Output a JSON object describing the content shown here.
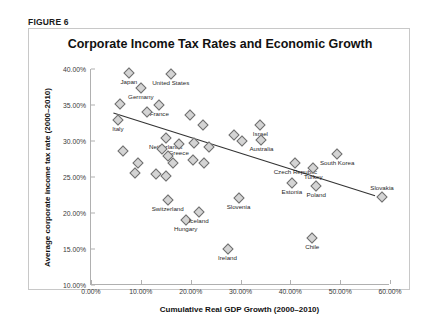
{
  "figure": {
    "tag": "FIGURE 6"
  },
  "chart_data": {
    "type": "scatter",
    "title": "Corporate Income Tax Rates and Economic Growth",
    "xlabel": "Cumulative Real GDP Growth (2000–2010)",
    "ylabel": "Average corporate income tax rate (2000–2010)",
    "xlim": [
      0,
      60
    ],
    "ylim": [
      10,
      40
    ],
    "xticks": [
      "0.00%",
      "10.00%",
      "20.00%",
      "30.00%",
      "40.00%",
      "50.00%",
      "60.00%"
    ],
    "xtick_values": [
      0,
      10,
      20,
      30,
      40,
      50,
      60
    ],
    "yticks": [
      "10.00%",
      "15.00%",
      "20.00%",
      "25.00%",
      "30.00%",
      "35.00%",
      "40.00%"
    ],
    "ytick_values": [
      10,
      15,
      20,
      25,
      30,
      35,
      40
    ],
    "grid": false,
    "legend": null,
    "marker": {
      "shape": "diamond",
      "fill": "#d4d4d4",
      "edge": "#6e6e6e"
    },
    "trendline": {
      "type": "linear",
      "color": "#333333",
      "x_start": 4.5,
      "y_start": 33.9,
      "x_end": 57.0,
      "y_end": 22.4
    },
    "points": [
      {
        "label": "Japan",
        "x": 7.6,
        "y": 39.5,
        "label_pos": "below"
      },
      {
        "label": "United States",
        "x": 16.0,
        "y": 39.3,
        "label_pos": "below"
      },
      {
        "label": "Germany",
        "x": 10.0,
        "y": 37.4,
        "label_pos": "below"
      },
      {
        "label": "France",
        "x": 13.7,
        "y": 35.0,
        "label_pos": "below"
      },
      {
        "label": "Italy",
        "x": 5.4,
        "y": 32.9,
        "label_pos": "below"
      },
      {
        "label": "Netherlands",
        "x": 15.0,
        "y": 30.4,
        "label_pos": "below"
      },
      {
        "label": "Greece",
        "x": 17.6,
        "y": 29.6,
        "label_pos": "below"
      },
      {
        "label": "Israel",
        "x": 34.0,
        "y": 32.2,
        "label_pos": "below"
      },
      {
        "label": "Australia",
        "x": 34.2,
        "y": 30.2,
        "label_pos": "below"
      },
      {
        "label": "Czech Republic",
        "x": 41.0,
        "y": 27.0,
        "label_pos": "below"
      },
      {
        "label": "South Korea",
        "x": 49.4,
        "y": 28.2,
        "label_pos": "below"
      },
      {
        "label": "Turkey",
        "x": 44.6,
        "y": 26.3,
        "label_pos": "below"
      },
      {
        "label": "Poland",
        "x": 45.2,
        "y": 23.8,
        "label_pos": "below"
      },
      {
        "label": "Estonia",
        "x": 40.3,
        "y": 24.1,
        "label_pos": "below"
      },
      {
        "label": "Slovakia",
        "x": 58.4,
        "y": 22.2,
        "label_pos": "above"
      },
      {
        "label": "Switzerland",
        "x": 15.4,
        "y": 21.8,
        "label_pos": "below"
      },
      {
        "label": "Hungary",
        "x": 19.0,
        "y": 19.0,
        "label_pos": "below"
      },
      {
        "label": "Iceland",
        "x": 21.6,
        "y": 20.1,
        "label_pos": "below"
      },
      {
        "label": "Ireland",
        "x": 27.4,
        "y": 15.0,
        "label_pos": "below"
      },
      {
        "label": "Chile",
        "x": 44.4,
        "y": 16.5,
        "label_pos": "below"
      },
      {
        "label": "Slovenia",
        "x": 29.6,
        "y": 22.1,
        "label_pos": "below"
      },
      {
        "label": "",
        "x": 5.8,
        "y": 35.2,
        "label_pos": "none"
      },
      {
        "label": "",
        "x": 11.3,
        "y": 34.0,
        "label_pos": "none"
      },
      {
        "label": "",
        "x": 6.4,
        "y": 28.6,
        "label_pos": "none"
      },
      {
        "label": "",
        "x": 9.5,
        "y": 27.0,
        "label_pos": "none"
      },
      {
        "label": "",
        "x": 8.9,
        "y": 25.6,
        "label_pos": "none"
      },
      {
        "label": "",
        "x": 14.3,
        "y": 28.9,
        "label_pos": "none"
      },
      {
        "label": "",
        "x": 15.4,
        "y": 27.9,
        "label_pos": "none"
      },
      {
        "label": "",
        "x": 16.5,
        "y": 26.9,
        "label_pos": "none"
      },
      {
        "label": "",
        "x": 13.1,
        "y": 25.4,
        "label_pos": "none"
      },
      {
        "label": "",
        "x": 15.0,
        "y": 25.2,
        "label_pos": "none"
      },
      {
        "label": "",
        "x": 19.8,
        "y": 33.6,
        "label_pos": "none"
      },
      {
        "label": "",
        "x": 22.4,
        "y": 32.2,
        "label_pos": "none"
      },
      {
        "label": "",
        "x": 20.6,
        "y": 29.7,
        "label_pos": "none"
      },
      {
        "label": "",
        "x": 23.7,
        "y": 29.2,
        "label_pos": "none"
      },
      {
        "label": "",
        "x": 20.4,
        "y": 27.3,
        "label_pos": "none"
      },
      {
        "label": "",
        "x": 22.7,
        "y": 27.0,
        "label_pos": "none"
      },
      {
        "label": "",
        "x": 28.6,
        "y": 30.8,
        "label_pos": "none"
      },
      {
        "label": "",
        "x": 30.4,
        "y": 30.0,
        "label_pos": "none"
      }
    ]
  }
}
